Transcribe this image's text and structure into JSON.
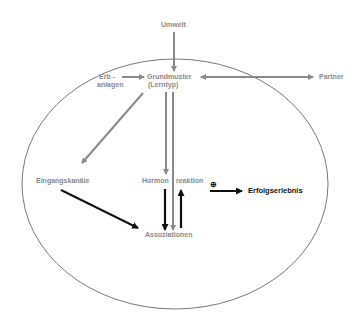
{
  "diagram": {
    "nodes": {
      "umwelt": "Umwelt",
      "erb": "Erb -",
      "anlagen": "anlagen",
      "grundmuster": "Grundmuster",
      "lerntyp": "(Lerntyp)",
      "partner": "Partner",
      "eingangskanaele": "Eingangskanäle",
      "hormon": "Hormon",
      "reaktion": "reaktion",
      "assoziationen": "Assoziationen",
      "plus": "⊕",
      "erfolgserlebnis": "Erfolgserlebnis"
    },
    "edges": [
      {
        "from": "Umwelt",
        "to": "Grundmuster (Lerntyp)",
        "color": "#8a8a8a"
      },
      {
        "from": "Erbanlagen",
        "to": "Grundmuster (Lerntyp)",
        "color": "#8a8a8a"
      },
      {
        "from": "Grundmuster (Lerntyp)",
        "to": "Partner",
        "bidirectional": true,
        "color": "#8a8a8a"
      },
      {
        "from": "Grundmuster (Lerntyp)",
        "to": "Eingangskanäle",
        "color": "#8a8a8a"
      },
      {
        "from": "Grundmuster (Lerntyp)",
        "to": "Hormonreaktion",
        "color": "#8a8a8a"
      },
      {
        "from": "Grundmuster (Lerntyp)",
        "to": "Assoziationen",
        "color": "#8a8a8a"
      },
      {
        "from": "Eingangskanäle",
        "to": "Assoziationen",
        "color": "#111111"
      },
      {
        "from": "Hormonreaktion",
        "to": "Assoziationen",
        "color": "#111111"
      },
      {
        "from": "Assoziationen",
        "to": "Hormonreaktion",
        "color": "#111111"
      },
      {
        "from": "Hormonreaktion",
        "to": "Erfolgserlebnis",
        "label": "⊕",
        "color": "#111111"
      }
    ],
    "colors": {
      "gray": "#8a8a8a",
      "dark": "#111111",
      "outline": "#555555"
    }
  }
}
